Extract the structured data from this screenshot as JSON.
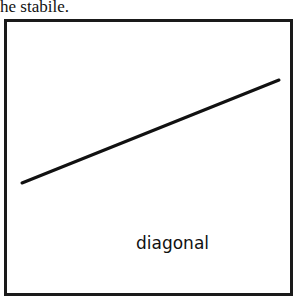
{
  "caption": {
    "text": "he stabile."
  },
  "figure": {
    "label": "diagonal",
    "line": {
      "x1": 22,
      "y1": 183,
      "x2": 279,
      "y2": 80,
      "color": "#111111",
      "width": 3
    },
    "frame_color": "#1a1a1a"
  }
}
